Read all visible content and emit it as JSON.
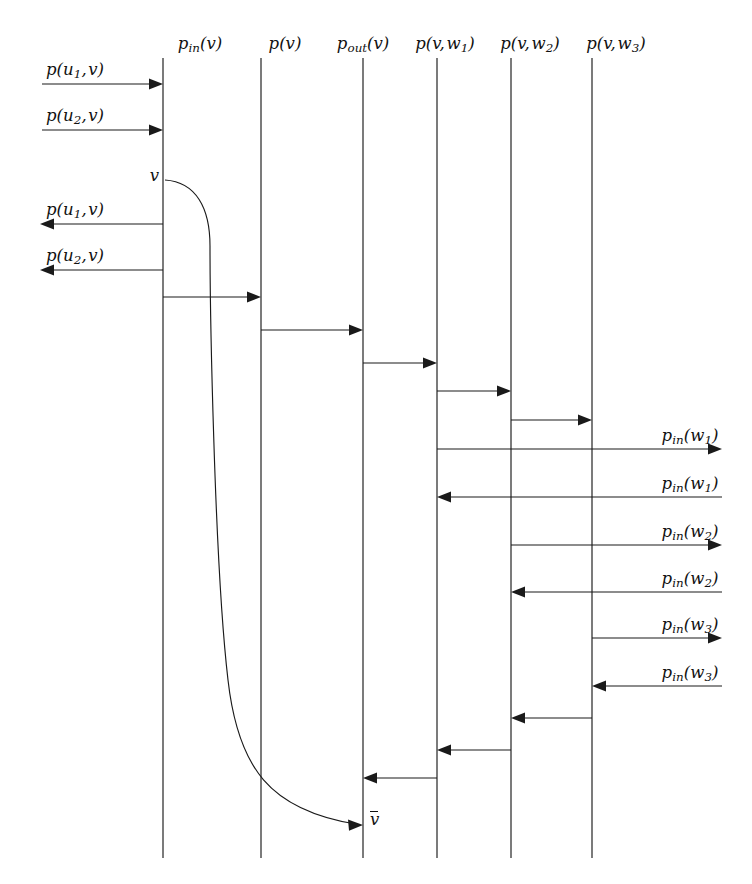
{
  "diagram": {
    "kind": "sequence-diagram",
    "background": "#ffffff",
    "ink": "#1a1a1a",
    "width": 752,
    "height": 884,
    "lifelines": [
      {
        "id": "p_in_v",
        "header": "p_in(v)",
        "x": 163,
        "top": 58,
        "bottom": 858
      },
      {
        "id": "p_v",
        "header": "p(v)",
        "x": 261,
        "top": 58,
        "bottom": 858
      },
      {
        "id": "p_out_v",
        "header": "p_out(v)",
        "x": 363,
        "top": 58,
        "bottom": 858
      },
      {
        "id": "p_v_w1",
        "header": "p(v,w1)",
        "x": 437,
        "top": 58,
        "bottom": 858
      },
      {
        "id": "p_v_w2",
        "header": "p(v,w2)",
        "x": 511,
        "top": 58,
        "bottom": 858
      },
      {
        "id": "p_v_w3",
        "header": "p(v,w3)",
        "x": 592,
        "top": 58,
        "bottom": 858
      }
    ],
    "headers": [
      {
        "text_main": "p",
        "text_sub": "in",
        "text_tail": "(v)",
        "x": 200,
        "y": 36
      },
      {
        "text_main": "p",
        "text_sub": "",
        "text_tail": "(v)",
        "x": 285,
        "y": 36
      },
      {
        "text_main": "p",
        "text_sub": "out",
        "text_tail": "(v)",
        "x": 363,
        "y": 36
      },
      {
        "text_main": "p",
        "text_sub": "",
        "text_tail": "(v, w1)",
        "x": 445,
        "y": 36
      },
      {
        "text_main": "p",
        "text_sub": "",
        "text_tail": "(v, w2)",
        "x": 530,
        "y": 36
      },
      {
        "text_main": "p",
        "text_sub": "",
        "text_tail": "(v, w3)",
        "x": 616,
        "y": 36
      }
    ],
    "messages": [
      {
        "id": "m1",
        "label": "p(u1, v)",
        "from_x": 42,
        "to_x": 163,
        "y": 84,
        "dir": "right",
        "label_x": 46,
        "label_y": 62,
        "align": "left"
      },
      {
        "id": "m2",
        "label": "p(u2, v)",
        "from_x": 42,
        "to_x": 163,
        "y": 130,
        "dir": "right",
        "label_x": 46,
        "label_y": 108,
        "align": "left"
      },
      {
        "id": "m3",
        "label": "p(u1, v)",
        "from_x": 163,
        "to_x": 40,
        "y": 224,
        "dir": "left",
        "label_x": 46,
        "label_y": 202,
        "align": "left"
      },
      {
        "id": "m4",
        "label": "p(u2, v)",
        "from_x": 163,
        "to_x": 40,
        "y": 270,
        "dir": "left",
        "label_x": 46,
        "label_y": 248,
        "align": "left"
      },
      {
        "id": "m5",
        "label": "",
        "from_x": 163,
        "to_x": 261,
        "y": 297,
        "dir": "right",
        "label_x": 0,
        "label_y": 0,
        "align": "none"
      },
      {
        "id": "m6",
        "label": "",
        "from_x": 261,
        "to_x": 363,
        "y": 330,
        "dir": "right",
        "label_x": 0,
        "label_y": 0,
        "align": "none"
      },
      {
        "id": "m7",
        "label": "",
        "from_x": 363,
        "to_x": 437,
        "y": 363,
        "dir": "right",
        "label_x": 0,
        "label_y": 0,
        "align": "none"
      },
      {
        "id": "m8",
        "label": "",
        "from_x": 437,
        "to_x": 511,
        "y": 391,
        "dir": "right",
        "label_x": 0,
        "label_y": 0,
        "align": "none"
      },
      {
        "id": "m9",
        "label": "",
        "from_x": 511,
        "to_x": 592,
        "y": 420,
        "dir": "right",
        "label_x": 0,
        "label_y": 0,
        "align": "none"
      },
      {
        "id": "m10",
        "label": "p_in(w1)",
        "from_x": 437,
        "to_x": 722,
        "y": 449,
        "dir": "right",
        "label_x": 636,
        "label_y": 428,
        "align": "center"
      },
      {
        "id": "m11",
        "label": "p_in(w1)",
        "from_x": 722,
        "to_x": 437,
        "y": 497,
        "dir": "left",
        "label_x": 636,
        "label_y": 476,
        "align": "center"
      },
      {
        "id": "m12",
        "label": "p_in(w2)",
        "from_x": 511,
        "to_x": 722,
        "y": 545,
        "dir": "right",
        "label_x": 636,
        "label_y": 524,
        "align": "center"
      },
      {
        "id": "m13",
        "label": "p_in(w2)",
        "from_x": 722,
        "to_x": 511,
        "y": 592,
        "dir": "left",
        "label_x": 636,
        "label_y": 571,
        "align": "center"
      },
      {
        "id": "m14",
        "label": "p_in(w3)",
        "from_x": 592,
        "to_x": 722,
        "y": 638,
        "dir": "right",
        "label_x": 636,
        "label_y": 617,
        "align": "center"
      },
      {
        "id": "m15",
        "label": "p_in(w3)",
        "from_x": 722,
        "to_x": 592,
        "y": 686,
        "dir": "left",
        "label_x": 636,
        "label_y": 665,
        "align": "center"
      },
      {
        "id": "m16",
        "label": "",
        "from_x": 592,
        "to_x": 511,
        "y": 718,
        "dir": "left",
        "label_x": 0,
        "label_y": 0,
        "align": "none"
      },
      {
        "id": "m17",
        "label": "",
        "from_x": 511,
        "to_x": 437,
        "y": 750,
        "dir": "left",
        "label_x": 0,
        "label_y": 0,
        "align": "none"
      },
      {
        "id": "m18",
        "label": "",
        "from_x": 437,
        "to_x": 363,
        "y": 778,
        "dir": "left",
        "label_x": 0,
        "label_y": 0,
        "align": "none"
      }
    ],
    "activation_curve": {
      "id": "v-activation",
      "start_label": "v",
      "start_label_x": 159,
      "start_label_y": 168,
      "end_label": "v-bar",
      "end_label_x": 370,
      "end_label_y": 812,
      "path": "M 165 180 C 196 182 210 208 210 246 C 210 300 214 560 228 680 C 238 768 270 810 356 824"
    },
    "notes": {
      "p_in_v_label": "p_in(v)",
      "p_v_label": "p(v)",
      "p_out_v_label": "p_out(v)",
      "p_v_w1_label": "p(v,w1)",
      "p_v_w2_label": "p(v,w2)",
      "p_v_w3_label": "p(v,w3)"
    }
  }
}
